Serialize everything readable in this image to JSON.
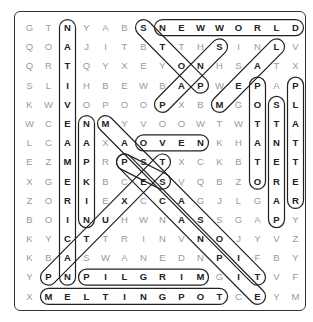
{
  "puzzle": {
    "rows": [
      "GTNYABSNEWWORLD",
      "QOAJITBTTHSINLV",
      "QRTQYXEYONHSATX",
      "SLIHBEWBAPWEPAP",
      "KWVOPOOPXBMGOSL",
      "WCENMYVOOWTWTTA",
      "LCAAXAOVENKHANT",
      "EZMPRPSTXCKBTET",
      "XGEKBCESVQBZORE",
      "ZORIEXCCAGJLGAR",
      "BOINUHWNASSGAPY",
      "KYCTTRINVNOJYVZ",
      "KBASWANEDNPIFBY",
      "YPNPILGRIMGITVF",
      "XMELTINGPOTCEYM"
    ],
    "found_words": [
      {
        "word": "NEWWORLD",
        "start": [
          0,
          7
        ],
        "end": [
          0,
          14
        ]
      },
      {
        "word": "NATIVEAMERICAN",
        "start": [
          0,
          2
        ],
        "end": [
          13,
          2
        ]
      },
      {
        "word": "NAPKIN",
        "start": [
          5,
          3
        ],
        "end": [
          10,
          3
        ]
      },
      {
        "word": "POTATO",
        "start": [
          3,
          12
        ],
        "end": [
          8,
          12
        ]
      },
      {
        "word": "STNERAP",
        "start": [
          4,
          13
        ],
        "end": [
          10,
          13
        ]
      },
      {
        "word": "PLATTER",
        "start": [
          3,
          14
        ],
        "end": [
          9,
          14
        ]
      },
      {
        "word": "OVEN",
        "start": [
          6,
          6
        ],
        "end": [
          6,
          9
        ]
      },
      {
        "word": "PILGRIM",
        "start": [
          13,
          3
        ],
        "end": [
          13,
          9
        ]
      },
      {
        "word": "MELTINGPOT",
        "start": [
          14,
          1
        ],
        "end": [
          14,
          10
        ]
      },
      {
        "word": "SNAP",
        "start": [
          1,
          10
        ],
        "end": [
          4,
          7
        ]
      },
      {
        "word": "SNAP2",
        "start": [
          0,
          6
        ],
        "end": [
          3,
          9
        ]
      },
      {
        "word": "LAEM",
        "start": [
          1,
          13
        ],
        "end": [
          4,
          10
        ]
      },
      {
        "word": "PSTS",
        "start": [
          7,
          5
        ],
        "end": [
          8,
          7
        ]
      },
      {
        "word": "MASCOT",
        "start": [
          5,
          4
        ],
        "end": [
          13,
          12
        ]
      },
      {
        "word": "PESCANOPIE",
        "start": [
          7,
          5
        ],
        "end": [
          14,
          12
        ]
      },
      {
        "word": "PTSEXUTP",
        "start": [
          7,
          7
        ],
        "end": [
          13,
          1
        ]
      }
    ]
  }
}
